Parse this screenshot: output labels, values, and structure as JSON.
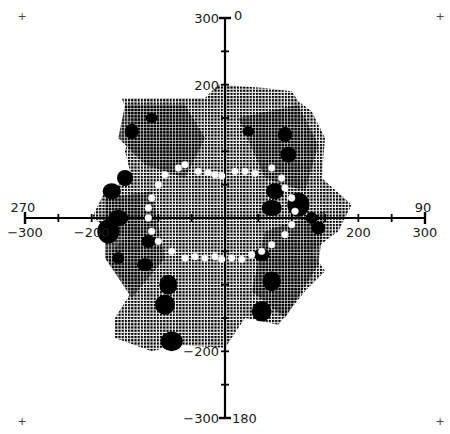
{
  "chart_data": {
    "type": "scatter",
    "title": "",
    "subtitle": "",
    "xlabel": "",
    "ylabel": "",
    "xlim": [
      -300,
      300
    ],
    "ylim": [
      -300,
      300
    ],
    "grid": false,
    "legend": null,
    "axes": {
      "x": {
        "ticks": [
          -300,
          -250,
          -200,
          -150,
          -100,
          -50,
          0,
          50,
          100,
          150,
          200,
          250,
          300
        ],
        "labeled_ticks": [
          {
            "value": -300,
            "label": "−300"
          },
          {
            "value": -200,
            "label": "−200"
          },
          {
            "value": 200,
            "label": "200"
          },
          {
            "value": 300,
            "label": "300"
          }
        ]
      },
      "y": {
        "ticks": [
          -300,
          -250,
          -200,
          -150,
          -100,
          -50,
          0,
          50,
          100,
          150,
          200,
          250,
          300
        ],
        "labeled_ticks": [
          {
            "value": 300,
            "label": "300"
          },
          {
            "value": 200,
            "label": "200"
          },
          {
            "value": -200,
            "label": "−200"
          },
          {
            "value": -300,
            "label": "−300"
          }
        ]
      }
    },
    "bearing_labels": [
      {
        "label": "0",
        "position": "top"
      },
      {
        "label": "90",
        "position": "right"
      },
      {
        "label": "180",
        "position": "bottom"
      },
      {
        "label": "270",
        "position": "left"
      }
    ],
    "corner_markers": [
      "+",
      "+",
      "+",
      "+"
    ],
    "series": [
      {
        "name": "dense point field",
        "style": "black dot-matrix",
        "extent_outline": [
          [
            -155,
            180
          ],
          [
            -30,
            180
          ],
          [
            -10,
            200
          ],
          [
            60,
            195
          ],
          [
            100,
            190
          ],
          [
            110,
            175
          ],
          [
            130,
            160
          ],
          [
            150,
            120
          ],
          [
            145,
            60
          ],
          [
            190,
            20
          ],
          [
            170,
            -20
          ],
          [
            130,
            -50
          ],
          [
            150,
            -80
          ],
          [
            120,
            -110
          ],
          [
            80,
            -160
          ],
          [
            30,
            -150
          ],
          [
            0,
            -195
          ],
          [
            -70,
            -190
          ],
          [
            -110,
            -200
          ],
          [
            -165,
            -180
          ],
          [
            -165,
            -150
          ],
          [
            -140,
            -110
          ],
          [
            -180,
            -60
          ],
          [
            -150,
            -30
          ],
          [
            -200,
            0
          ],
          [
            -180,
            40
          ],
          [
            -140,
            60
          ],
          [
            -150,
            100
          ],
          [
            -140,
            140
          ]
        ]
      },
      {
        "name": "dense clusters",
        "style": "solid black blobs",
        "points": [
          [
            -110,
            150
          ],
          [
            -140,
            130
          ],
          [
            -150,
            60
          ],
          [
            -170,
            40
          ],
          [
            -160,
            0
          ],
          [
            -175,
            -20
          ],
          [
            -160,
            -60
          ],
          [
            -115,
            -35
          ],
          [
            -120,
            -70
          ],
          [
            -85,
            -100
          ],
          [
            -90,
            -130
          ],
          [
            -80,
            -185
          ],
          [
            35,
            130
          ],
          [
            90,
            125
          ],
          [
            95,
            95
          ],
          [
            75,
            40
          ],
          [
            70,
            15
          ],
          [
            110,
            20
          ],
          [
            130,
            0
          ],
          [
            140,
            -15
          ],
          [
            55,
            -55
          ],
          [
            70,
            -95
          ],
          [
            55,
            -140
          ]
        ]
      },
      {
        "name": "ellipse markers",
        "style": "white filled circles",
        "points": [
          [
            -100,
            50
          ],
          [
            -90,
            65
          ],
          [
            -70,
            75
          ],
          [
            -60,
            80
          ],
          [
            -40,
            70
          ],
          [
            -25,
            68
          ],
          [
            -15,
            65
          ],
          [
            -5,
            63
          ],
          [
            15,
            70
          ],
          [
            30,
            70
          ],
          [
            45,
            67
          ],
          [
            70,
            75
          ],
          [
            85,
            60
          ],
          [
            90,
            45
          ],
          [
            100,
            30
          ],
          [
            105,
            10
          ],
          [
            100,
            -10
          ],
          [
            90,
            -25
          ],
          [
            70,
            -40
          ],
          [
            55,
            -50
          ],
          [
            40,
            -55
          ],
          [
            25,
            -62
          ],
          [
            10,
            -60
          ],
          [
            -5,
            -62
          ],
          [
            -15,
            -58
          ],
          [
            -30,
            -60
          ],
          [
            -45,
            -58
          ],
          [
            -60,
            -60
          ],
          [
            -80,
            -50
          ],
          [
            -100,
            -35
          ],
          [
            -110,
            -20
          ],
          [
            -115,
            0
          ],
          [
            -115,
            15
          ],
          [
            -110,
            30
          ]
        ]
      }
    ]
  }
}
